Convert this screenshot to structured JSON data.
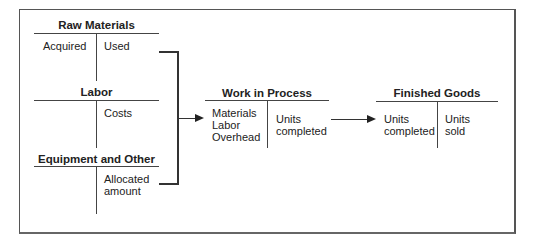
{
  "diagram": {
    "accounts": {
      "raw_materials": {
        "title": "Raw Materials",
        "debit": "Acquired",
        "credit": "Used"
      },
      "labor": {
        "title": "Labor",
        "debit": "",
        "credit": "Costs"
      },
      "equipment": {
        "title": "Equipment and Other",
        "debit": "",
        "credit_line1": "Allocated",
        "credit_line2": "amount"
      },
      "work_in_process": {
        "title": "Work in Process",
        "debit_line1": "Materials",
        "debit_line2": "Labor",
        "debit_line3": "Overhead",
        "credit_line1": "Units",
        "credit_line2": "completed"
      },
      "finished_goods": {
        "title": "Finished Goods",
        "debit_line1": "Units",
        "debit_line2": "completed",
        "credit_line1": "Units",
        "credit_line2": "sold"
      }
    },
    "colors": {
      "line": "#444444",
      "text": "#222222",
      "background": "#ffffff"
    }
  }
}
